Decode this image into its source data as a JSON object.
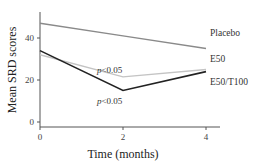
{
  "chart_data": {
    "type": "line",
    "title": "",
    "xlabel": "Time (months)",
    "ylabel": "Mean SRD scores",
    "x": [
      0,
      2,
      4
    ],
    "xticks": [
      "0",
      "2",
      "4"
    ],
    "yticks": [
      "0",
      "20",
      "40"
    ],
    "xlim": [
      0,
      4
    ],
    "ylim": [
      0,
      50
    ],
    "grid": false,
    "legend_position": "inline-right",
    "series": [
      {
        "name": "Placebo",
        "values": [
          47,
          41,
          35
        ],
        "color": "#8a8a8a"
      },
      {
        "name": "E50",
        "values": [
          32,
          21.5,
          25
        ],
        "color": "#c4c4c4"
      },
      {
        "name": "E50/T100",
        "values": [
          34,
          15,
          24
        ],
        "color": "#222222"
      }
    ],
    "annotations": [
      {
        "text": "p<0.05",
        "x": 2,
        "series": "E50",
        "position": "above"
      },
      {
        "text": "p<0.05",
        "x": 2,
        "series": "E50/T100",
        "position": "below"
      }
    ]
  }
}
